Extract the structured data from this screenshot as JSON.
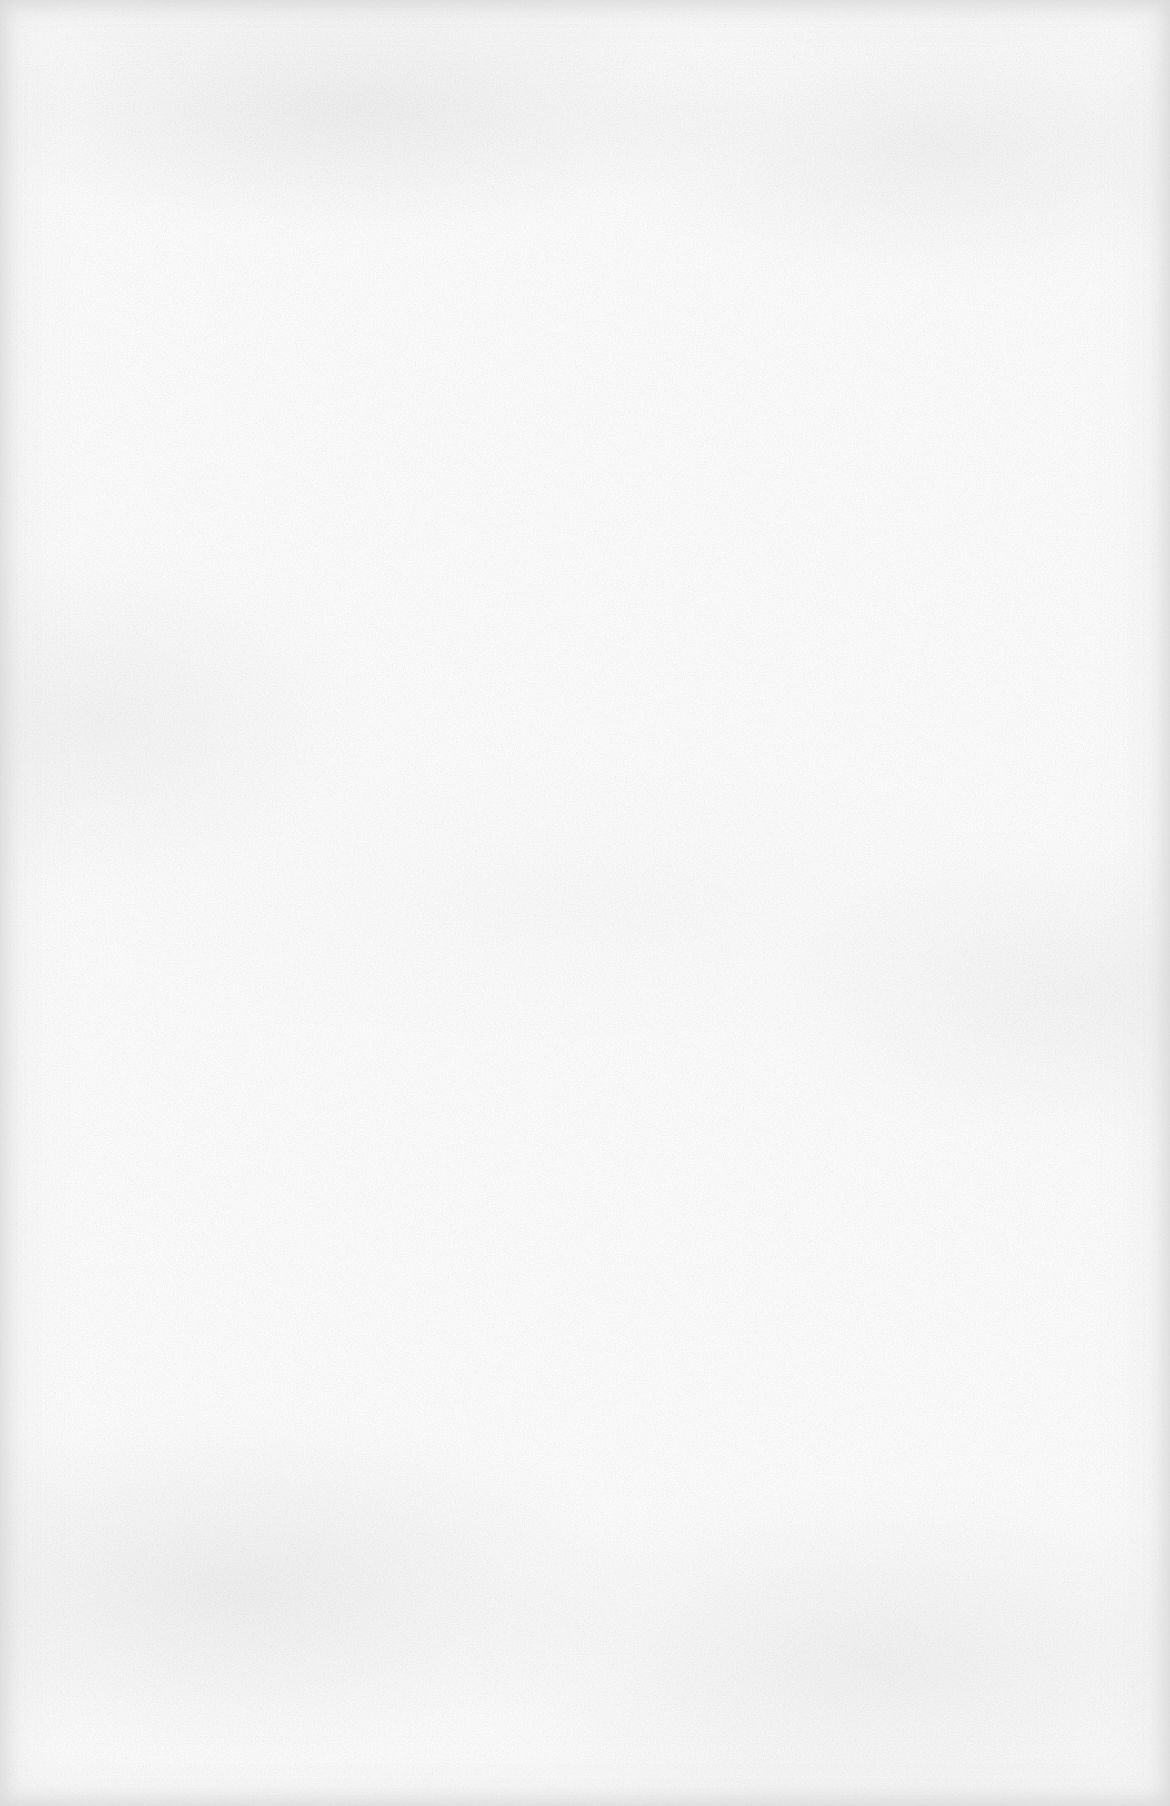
{
  "page": {
    "colors": {
      "paper": "#fbfbfb",
      "edge": "#ececec",
      "speckle": "#c8c8c8"
    }
  }
}
